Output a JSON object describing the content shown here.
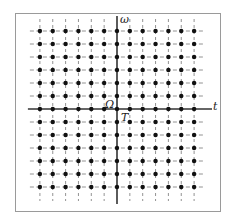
{
  "diagram": {
    "type": "lattice",
    "axes": {
      "horizontal_label": "t",
      "vertical_label": "ω"
    },
    "annotations": {
      "frequency_spacing_label": "Ω",
      "time_spacing_label": "T"
    },
    "lattice": {
      "columns": 13,
      "rows": 13,
      "origin_col_index": 6,
      "origin_row_index": 6
    },
    "colors": {
      "dot": "#111111",
      "axis": "#333333",
      "grid": "#777777",
      "frame": "#9a9a9a"
    }
  }
}
